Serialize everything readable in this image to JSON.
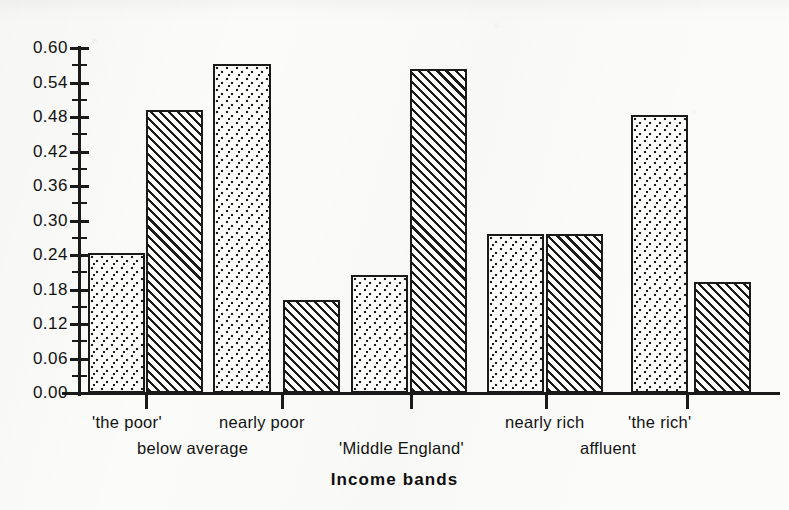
{
  "chart_data": {
    "type": "bar",
    "title": "",
    "xlabel": "Income bands",
    "ylabel": "",
    "ylim": [
      0.0,
      0.6
    ],
    "ytick_step": 0.06,
    "grid": false,
    "legend": "none",
    "categories": [
      "'the poor'",
      "nearly poor",
      "'Middle England'",
      "nearly rich",
      "'the rich'"
    ],
    "category_group_labels": [
      "below average",
      "'Middle England'",
      "affluent"
    ],
    "series": [
      {
        "name": "first bar (dotted)",
        "pattern": "dotted",
        "values": [
          0.243,
          0.573,
          0.205,
          0.277,
          0.484
        ]
      },
      {
        "name": "second bar (hatched)",
        "pattern": "hatched",
        "values": [
          0.492,
          0.161,
          0.563,
          0.277,
          0.193
        ]
      }
    ],
    "ytick_labels": [
      "0.00",
      "0.06",
      "0.12",
      "0.18",
      "0.24",
      "0.30",
      "0.36",
      "0.42",
      "0.48",
      "0.54",
      "0.60"
    ],
    "ytick_values": [
      0.0,
      0.06,
      0.12,
      0.18,
      0.24,
      0.3,
      0.36,
      0.42,
      0.48,
      0.54,
      0.6
    ],
    "ytick_labeled_values": [
      0.0,
      0.06,
      0.12,
      0.18,
      0.24,
      0.3,
      0.36,
      0.42,
      0.48,
      0.54,
      0.6
    ],
    "ytick_minor_values": [
      0.03,
      0.09,
      0.15,
      0.21,
      0.27,
      0.33,
      0.39,
      0.45,
      0.51,
      0.57
    ],
    "bars": [
      {
        "label": "'the poor' A",
        "value": 0.243,
        "pattern": "dotted",
        "x": 88,
        "width": 57
      },
      {
        "label": "'the poor' B",
        "value": 0.492,
        "pattern": "hatched",
        "x": 146,
        "width": 57
      },
      {
        "label": "nearly poor A",
        "value": 0.573,
        "pattern": "dotted",
        "x": 213,
        "width": 58
      },
      {
        "label": "nearly poor B",
        "value": 0.161,
        "pattern": "hatched",
        "x": 283,
        "width": 57
      },
      {
        "label": "'Middle England' A",
        "value": 0.205,
        "pattern": "dotted",
        "x": 351,
        "width": 57
      },
      {
        "label": "'Middle England' B",
        "value": 0.563,
        "pattern": "hatched",
        "x": 410,
        "width": 57
      },
      {
        "label": "nearly rich A",
        "value": 0.277,
        "pattern": "dotted",
        "x": 487,
        "width": 57
      },
      {
        "label": "nearly rich B",
        "value": 0.277,
        "pattern": "hatched",
        "x": 546,
        "width": 57
      },
      {
        "label": "'the rich' A",
        "value": 0.484,
        "pattern": "dotted",
        "x": 631,
        "width": 57
      },
      {
        "label": "'the rich' B",
        "value": 0.193,
        "pattern": "hatched",
        "x": 694,
        "width": 57
      }
    ],
    "xticks": [
      145,
      281,
      410,
      545,
      686
    ],
    "x_labels_row1": [
      {
        "text": "'the poor'",
        "x": 92
      },
      {
        "text": "nearly poor",
        "x": 219
      },
      {
        "text": "nearly rich",
        "x": 505
      },
      {
        "text": "'the rich'",
        "x": 628
      }
    ],
    "x_labels_row2": [
      {
        "text": "below average",
        "x": 137
      },
      {
        "text": "'Middle England'",
        "x": 339
      },
      {
        "text": "affluent",
        "x": 580
      }
    ]
  }
}
